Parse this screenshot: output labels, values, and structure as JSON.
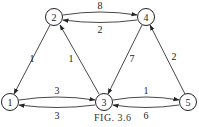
{
  "caption": "FIG. 3.6",
  "nodes": [
    {
      "id": "1",
      "label": "1",
      "x": 10,
      "y": 102
    },
    {
      "id": "2",
      "label": "2",
      "x": 54,
      "y": 17
    },
    {
      "id": "3",
      "label": "3",
      "x": 104,
      "y": 102
    },
    {
      "id": "4",
      "label": "4",
      "x": 146,
      "y": 17
    },
    {
      "id": "5",
      "label": "5",
      "x": 188,
      "y": 102
    }
  ],
  "edges": [
    {
      "from": "2",
      "to": "4",
      "weight": "8"
    },
    {
      "from": "4",
      "to": "2",
      "weight": "2"
    },
    {
      "from": "2",
      "to": "1",
      "weight": "1"
    },
    {
      "from": "3",
      "to": "2",
      "weight": "1"
    },
    {
      "from": "4",
      "to": "3",
      "weight": "7"
    },
    {
      "from": "5",
      "to": "4",
      "weight": "2"
    },
    {
      "from": "1",
      "to": "3",
      "weight": "3"
    },
    {
      "from": "3",
      "to": "1",
      "weight": "3"
    },
    {
      "from": "3",
      "to": "5",
      "weight": "1"
    },
    {
      "from": "5",
      "to": "3",
      "weight": "6"
    }
  ]
}
